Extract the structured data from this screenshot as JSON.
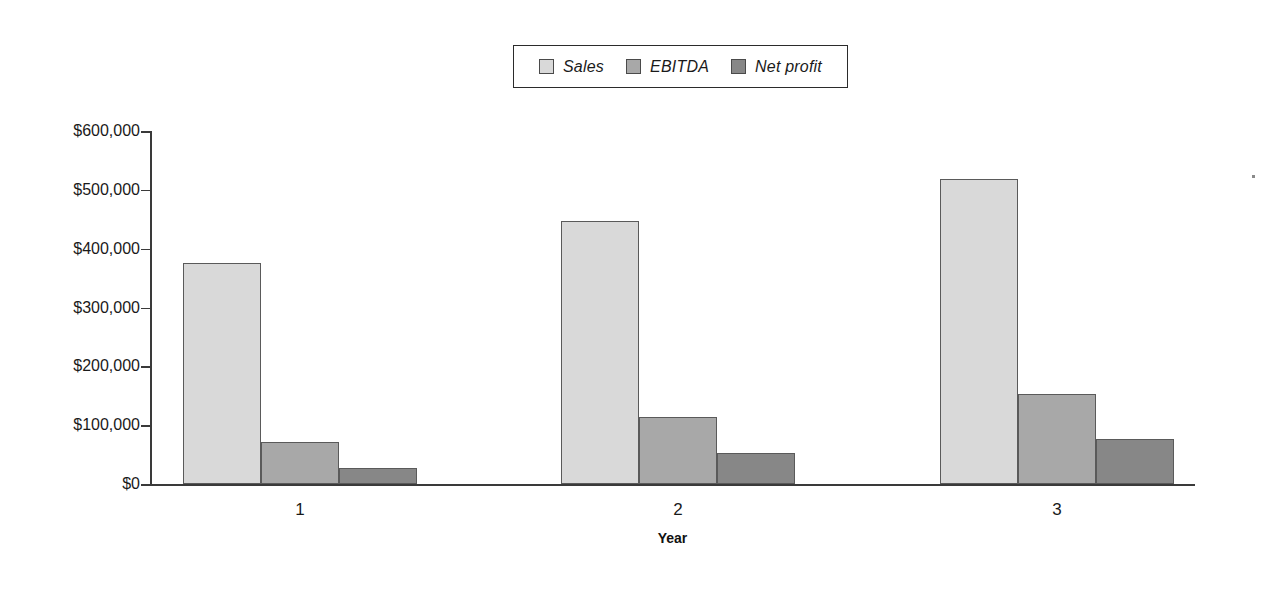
{
  "chart_data": {
    "type": "bar",
    "title": "",
    "subtitle": "",
    "xlabel": "Year",
    "ylabel": "",
    "categories": [
      "1",
      "2",
      "3"
    ],
    "series": [
      {
        "name": "Sales",
        "values": [
          376000,
          447000,
          518000
        ],
        "color": "#d9d9d9"
      },
      {
        "name": "EBITDA",
        "values": [
          72000,
          114000,
          153000
        ],
        "color": "#a8a8a8"
      },
      {
        "name": "Net profit",
        "values": [
          27000,
          52000,
          76000
        ],
        "color": "#878787"
      }
    ],
    "ylim": [
      0,
      600000
    ],
    "ytick_values": [
      0,
      100000,
      200000,
      300000,
      400000,
      500000,
      600000
    ],
    "ytick_labels": [
      "$0",
      "$100,000",
      "$200,000",
      "$300,000",
      "$400,000",
      "$500,000",
      "$600,000"
    ],
    "grid": false,
    "legend_position": "top-center",
    "legend_entries": [
      "Sales",
      "EBITDA",
      "Net profit"
    ],
    "annotations": []
  },
  "legend": {
    "items": [
      {
        "label": "Sales",
        "swatch": "legend-swatch-sales"
      },
      {
        "label": "EBITDA",
        "swatch": "legend-swatch-ebitda"
      },
      {
        "label": "Net profit",
        "swatch": "legend-swatch-net-profit"
      }
    ]
  },
  "axes": {
    "x_title": "Year",
    "x_tick_labels": [
      "1",
      "2",
      "3"
    ],
    "y_tick_labels": [
      "$600,000",
      "$500,000",
      "$400,000",
      "$300,000",
      "$200,000",
      "$100,000",
      "$0"
    ]
  },
  "colors": {
    "sales": "#d9d9d9",
    "ebitda": "#a8a8a8",
    "net_profit": "#878787",
    "axis": "#3a3a3a",
    "bar_outline": "#5a5a5a",
    "background": "#ffffff",
    "text": "#1a1a1a"
  }
}
